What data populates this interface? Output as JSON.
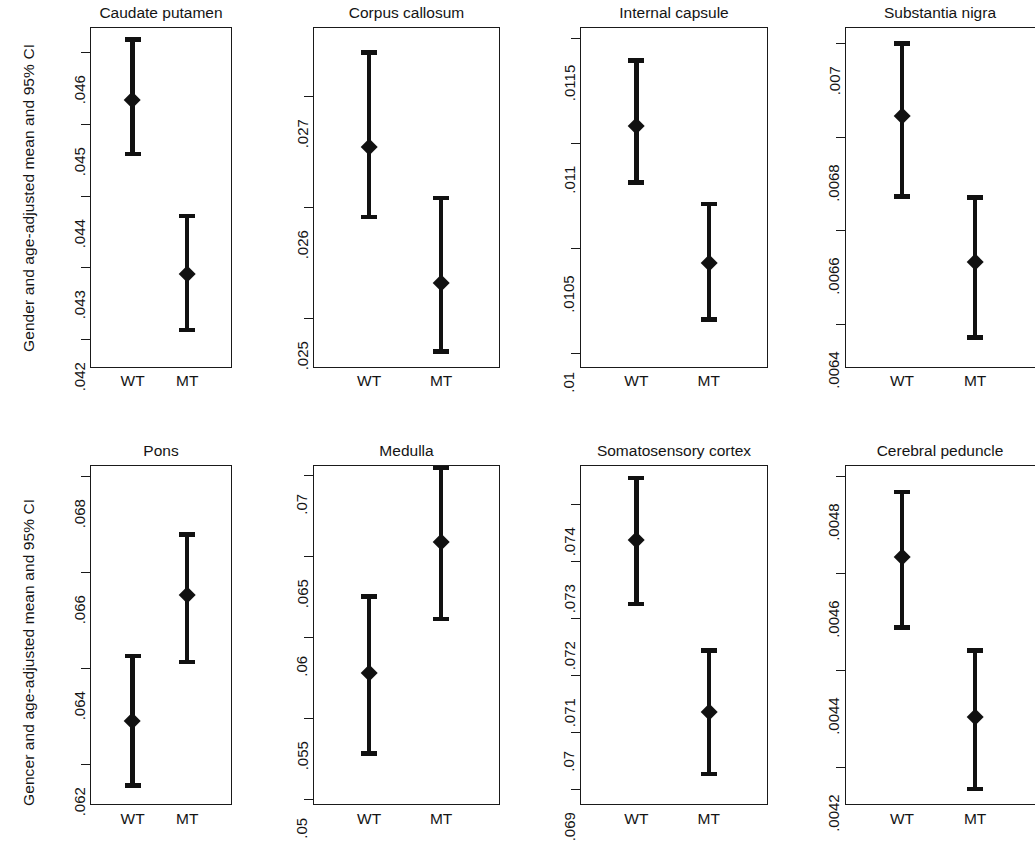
{
  "figure": {
    "row_axis_titles": [
      "Gender and age-adjusted mean and 95% CI",
      "Gencer and age-adjusted mean and 95% CI"
    ],
    "group_labels": [
      "WT",
      "MT"
    ]
  },
  "chart_data": {
    "type": "scatter",
    "title": "",
    "xlabel": "",
    "ylabel": "Gender and age-adjusted mean and 95% CI",
    "grid": false,
    "legend": "none",
    "categories": [
      "WT",
      "MT"
    ],
    "panels": [
      {
        "title": "Caudate putamen",
        "row": 0,
        "col": 0,
        "ylim": [
          0.0416,
          0.04635
        ],
        "yticks": [
          0.046,
          0.045,
          0.044,
          0.043,
          0.042
        ],
        "ytick_labels": [
          ".046",
          ".045",
          ".044",
          ".043",
          ".042"
        ],
        "points": [
          {
            "group": "WT",
            "mean": 0.04533,
            "low": 0.04458,
            "high": 0.04618
          },
          {
            "group": "MT",
            "mean": 0.04291,
            "low": 0.04213,
            "high": 0.04372
          }
        ]
      },
      {
        "title": "Corpus callosum",
        "row": 0,
        "col": 1,
        "ylim": [
          0.02455,
          0.02762
        ],
        "yticks": [
          0.027,
          0.026,
          0.025
        ],
        "ytick_labels": [
          ".027",
          ".026",
          ".025"
        ],
        "points": [
          {
            "group": "WT",
            "mean": 0.02654,
            "low": 0.02591,
            "high": 0.02739
          },
          {
            "group": "MT",
            "mean": 0.02531,
            "low": 0.0247,
            "high": 0.02608
          }
        ]
      },
      {
        "title": "Internal capsule",
        "row": 0,
        "col": 2,
        "ylim": [
          0.00993,
          0.01155
        ],
        "yticks": [
          0.0115,
          0.011,
          0.0105,
          0.01
        ],
        "ytick_labels": [
          ".0115",
          ".011",
          ".0105",
          ".01"
        ],
        "points": [
          {
            "group": "WT",
            "mean": 0.01108,
            "low": 0.01081,
            "high": 0.01139
          },
          {
            "group": "MT",
            "mean": 0.01043,
            "low": 0.01016,
            "high": 0.01071
          }
        ]
      },
      {
        "title": "Substantia nigra",
        "row": 0,
        "col": 3,
        "ylim": [
          0.006305,
          0.007035
        ],
        "yticks": [
          0.007,
          0.0068,
          0.0066,
          0.0064
        ],
        "ytick_labels": [
          ".007",
          ".0068",
          ".0066",
          ".0064"
        ],
        "points": [
          {
            "group": "WT",
            "mean": 0.006843,
            "low": 0.006672,
            "high": 0.007
          },
          {
            "group": "MT",
            "mean": 0.006532,
            "low": 0.00637,
            "high": 0.00667
          }
        ]
      },
      {
        "title": "Pons",
        "row": 1,
        "col": 0,
        "ylim": [
          0.06115,
          0.06822
        ],
        "yticks": [
          0.068,
          0.066,
          0.064,
          0.062
        ],
        "ytick_labels": [
          ".068",
          ".066",
          ".064",
          ".062"
        ],
        "points": [
          {
            "group": "WT",
            "mean": 0.0629,
            "low": 0.06155,
            "high": 0.06425
          },
          {
            "group": "MT",
            "mean": 0.06551,
            "low": 0.06412,
            "high": 0.06678
          }
        ]
      },
      {
        "title": "Medulla",
        "row": 1,
        "col": 1,
        "ylim": [
          0.04962,
          0.07062
        ],
        "yticks": [
          0.07,
          0.065,
          0.06,
          0.055,
          0.05
        ],
        "ytick_labels": [
          ".07",
          ".065",
          ".06",
          ".055",
          ".05"
        ],
        "points": [
          {
            "group": "WT",
            "mean": 0.05775,
            "low": 0.05281,
            "high": 0.06251
          },
          {
            "group": "MT",
            "mean": 0.06584,
            "low": 0.06111,
            "high": 0.07043
          }
        ]
      },
      {
        "title": "Somatosensory cortex",
        "row": 1,
        "col": 2,
        "ylim": [
          0.06872,
          0.07468
        ],
        "yticks": [
          0.074,
          0.073,
          0.072,
          0.071,
          0.07,
          0.069
        ],
        "ytick_labels": [
          ".074",
          ".073",
          ".072",
          ".071",
          ".07",
          ".069"
        ],
        "points": [
          {
            "group": "WT",
            "mean": 0.07337,
            "low": 0.07224,
            "high": 0.07445
          },
          {
            "group": "MT",
            "mean": 0.07035,
            "low": 0.06926,
            "high": 0.07143
          }
        ]
      },
      {
        "title": "Cerebral peduncle",
        "row": 1,
        "col": 3,
        "ylim": [
          0.004122,
          0.004822
        ],
        "yticks": [
          0.0048,
          0.0046,
          0.0044,
          0.0042
        ],
        "ytick_labels": [
          ".0048",
          ".0046",
          ".0044",
          ".0042"
        ],
        "points": [
          {
            "group": "WT",
            "mean": 0.004632,
            "low": 0.004487,
            "high": 0.004766
          },
          {
            "group": "MT",
            "mean": 0.004302,
            "low": 0.004155,
            "high": 0.00444
          }
        ]
      }
    ]
  }
}
